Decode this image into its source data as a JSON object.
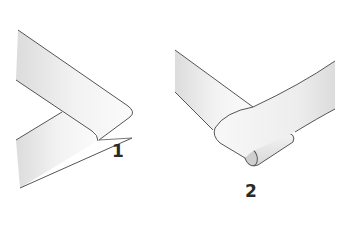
{
  "figure": {
    "type": "ribbon-fold-illustration",
    "panels": [
      {
        "label": "1",
        "description": "Ribbon folded back at an angle forming a pointed corner"
      },
      {
        "label": "2",
        "description": "Ribbon folded over and rolled under forming a loop"
      }
    ],
    "colors": {
      "outline": "#555555",
      "shade": "#d9d9d9",
      "fill": "#f7f7f7",
      "label": "#2a2a2a"
    }
  }
}
